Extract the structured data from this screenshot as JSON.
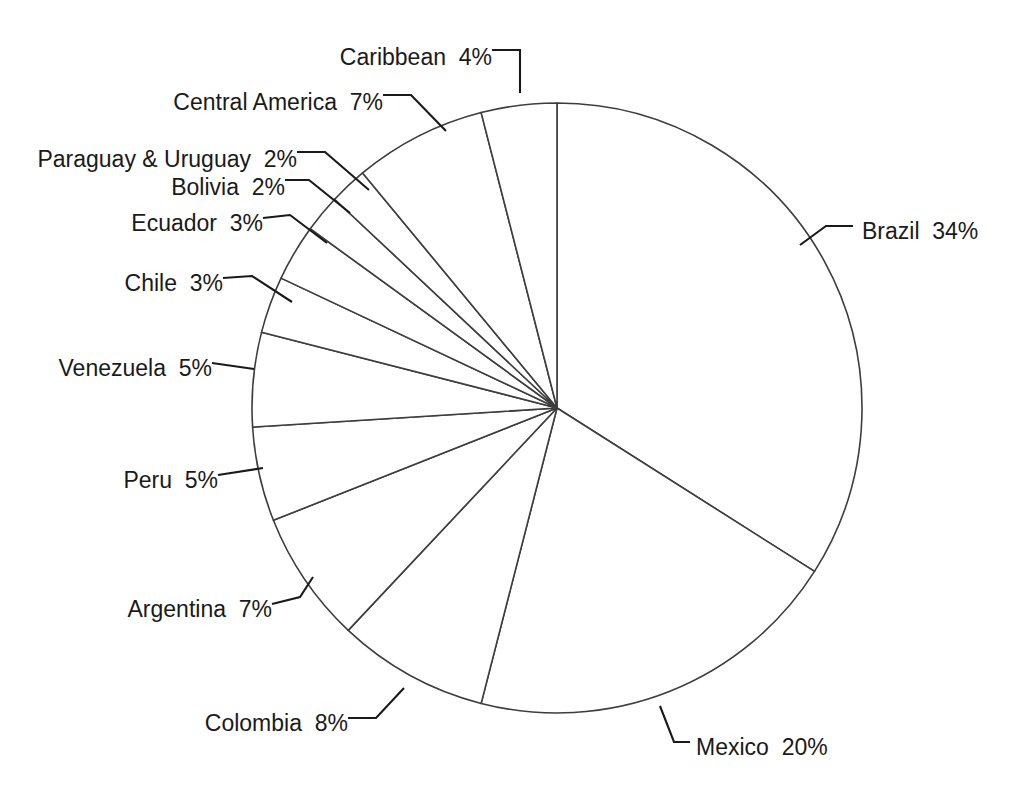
{
  "chart_data": {
    "type": "pie",
    "title": "",
    "subtitle": "",
    "xlabel": "",
    "ylabel": "",
    "grid": false,
    "legend_position": "none",
    "value_unit": "%",
    "start_angle_deg": 0,
    "direction": "clockwise",
    "slice_fill": "#ffffff",
    "slice_stroke": "#3d3d3d",
    "label_color": "#1a1a1a",
    "categories": [
      "Brazil",
      "Mexico",
      "Colombia",
      "Argentina",
      "Peru",
      "Venezuela",
      "Chile",
      "Ecuador",
      "Bolivia",
      "Paraguay & Uruguay",
      "Central America",
      "Caribbean"
    ],
    "values": [
      34,
      20,
      8,
      7,
      5,
      5,
      3,
      3,
      2,
      2,
      7,
      4
    ],
    "slices": [
      {
        "label": "Brazil",
        "value": 34,
        "text": "Brazil  34%"
      },
      {
        "label": "Mexico",
        "value": 20,
        "text": "Mexico  20%"
      },
      {
        "label": "Colombia",
        "value": 8,
        "text": "Colombia  8%"
      },
      {
        "label": "Argentina",
        "value": 7,
        "text": "Argentina  7%"
      },
      {
        "label": "Peru",
        "value": 5,
        "text": "Peru  5%"
      },
      {
        "label": "Venezuela",
        "value": 5,
        "text": "Venezuela  5%"
      },
      {
        "label": "Chile",
        "value": 3,
        "text": "Chile  3%"
      },
      {
        "label": "Ecuador",
        "value": 3,
        "text": "Ecuador  3%"
      },
      {
        "label": "Bolivia",
        "value": 2,
        "text": "Bolivia  2%"
      },
      {
        "label": "Paraguay & Uruguay",
        "value": 2,
        "text": "Paraguay & Uruguay  2%"
      },
      {
        "label": "Central America",
        "value": 7,
        "text": "Central America  7%"
      },
      {
        "label": "Caribbean",
        "value": 4,
        "text": "Caribbean  4%"
      }
    ]
  },
  "labels": {
    "caribbean": "Caribbean  4%",
    "central_america": "Central America  7%",
    "paraguay_uruguay": "Paraguay & Uruguay  2%",
    "bolivia": "Bolivia  2%",
    "ecuador": "Ecuador  3%",
    "chile": "Chile  3%",
    "venezuela": "Venezuela  5%",
    "peru": "Peru  5%",
    "argentina": "Argentina  7%",
    "colombia": "Colombia  8%",
    "mexico": "Mexico  20%",
    "brazil": "Brazil  34%"
  }
}
